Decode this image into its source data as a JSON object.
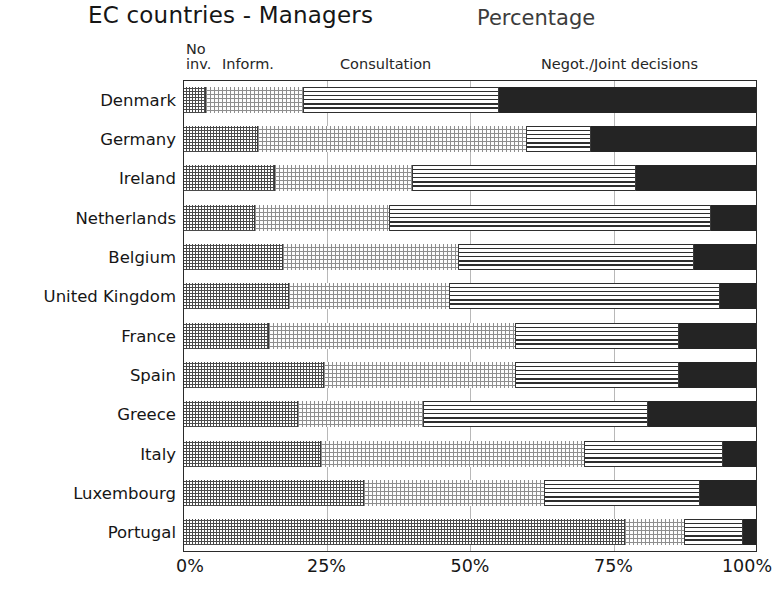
{
  "header": {
    "title": "EC countries - Managers",
    "percentage_label": "Percentage"
  },
  "legend": {
    "no_inv_line1": "No",
    "no_inv_line2": "inv.",
    "inform": "Inform.",
    "consultation": "Consultation",
    "negot": "Negot./Joint decisions"
  },
  "axis": {
    "xticks": [
      "0%",
      "25%",
      "50%",
      "75%",
      "100%"
    ],
    "xtick_values": [
      0,
      25,
      50,
      75,
      100
    ]
  },
  "chart_data": {
    "type": "bar",
    "title": "EC countries - Managers",
    "subtitle": "Percentage",
    "orientation": "horizontal",
    "stacked": true,
    "normalized": true,
    "xlabel": "Percentage",
    "ylabel": "",
    "xlim": [
      0,
      100
    ],
    "grid": true,
    "legend_position": "top",
    "categories": [
      "Denmark",
      "Germany",
      "Ireland",
      "Netherlands",
      "Belgium",
      "United Kingdom",
      "France",
      "Spain",
      "Greece",
      "Italy",
      "Luxembourg",
      "Portugal"
    ],
    "series": [
      {
        "name": "No inv.",
        "pattern": "checkerboard",
        "values": [
          4,
          13,
          16,
          12.5,
          17.5,
          18.5,
          15,
          24.5,
          20,
          24,
          31.5,
          77
        ]
      },
      {
        "name": "Inform.",
        "pattern": "fine-dotted",
        "values": [
          17,
          47,
          24,
          23.5,
          30.5,
          28,
          43,
          33.5,
          22,
          46,
          31.5,
          10.5
        ]
      },
      {
        "name": "Consultation",
        "pattern": "horizontal-lines",
        "values": [
          34,
          11,
          39,
          56,
          41,
          47,
          28.5,
          28.5,
          39,
          24,
          27,
          10
        ]
      },
      {
        "name": "Negot./Joint decisions",
        "pattern": "solid-black",
        "values": [
          45,
          29,
          21,
          8,
          11,
          6.5,
          13.5,
          13.5,
          19,
          6,
          10,
          2.5
        ]
      }
    ]
  }
}
